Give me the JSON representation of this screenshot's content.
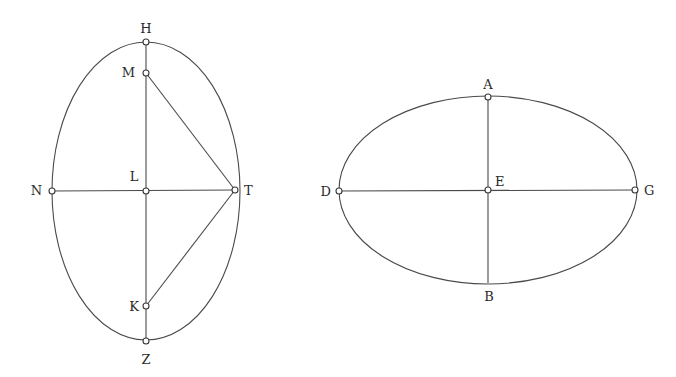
{
  "figures": [
    {
      "id": "vertical-ellipse",
      "ellipse": {
        "cx": 146,
        "cy": 191,
        "rx": 94,
        "ry": 149
      },
      "points": {
        "H": {
          "label": "H",
          "x": 146,
          "y": 42,
          "lx": 146,
          "ly": 33,
          "anchor": "middle",
          "marker": true
        },
        "M": {
          "label": "M",
          "x": 146,
          "y": 73,
          "lx": 135,
          "ly": 77,
          "anchor": "end",
          "marker": true
        },
        "N": {
          "label": "N",
          "x": 52,
          "y": 191,
          "lx": 42,
          "ly": 195,
          "anchor": "end",
          "marker": true
        },
        "L": {
          "label": "L",
          "x": 146,
          "y": 191,
          "lx": 134,
          "ly": 181,
          "anchor": "middle",
          "marker": true
        },
        "T": {
          "label": "T",
          "x": 235,
          "y": 190,
          "lx": 244,
          "ly": 195,
          "anchor": "start",
          "marker": true
        },
        "K": {
          "label": "K",
          "x": 146,
          "y": 306,
          "lx": 139,
          "ly": 311,
          "anchor": "end",
          "marker": true
        },
        "Z": {
          "label": "Z",
          "x": 146,
          "y": 341,
          "lx": 146,
          "ly": 364,
          "anchor": "middle",
          "marker": true
        }
      },
      "segments": [
        [
          "H",
          "Z"
        ],
        [
          "N",
          "T"
        ],
        [
          "M",
          "T"
        ],
        [
          "K",
          "T"
        ]
      ]
    },
    {
      "id": "horizontal-ellipse",
      "ellipse": {
        "cx": 488,
        "cy": 190,
        "rx": 149,
        "ry": 94
      },
      "points": {
        "A": {
          "label": "A",
          "x": 488,
          "y": 97,
          "lx": 488,
          "ly": 89,
          "anchor": "middle",
          "marker": true
        },
        "D": {
          "label": "D",
          "x": 339,
          "y": 191,
          "lx": 331,
          "ly": 196,
          "anchor": "end",
          "marker": true
        },
        "E": {
          "label": "E",
          "x": 488,
          "y": 190,
          "lx": 495,
          "ly": 186,
          "anchor": "start",
          "marker": true
        },
        "G": {
          "label": "G",
          "x": 635,
          "y": 190,
          "lx": 644,
          "ly": 195,
          "anchor": "start",
          "marker": true
        },
        "B": {
          "label": "B",
          "x": 488,
          "y": 283,
          "lx": 489,
          "ly": 301,
          "anchor": "middle",
          "marker": false
        }
      },
      "segments": [
        [
          "A",
          "B"
        ],
        [
          "D",
          "G"
        ]
      ]
    }
  ]
}
